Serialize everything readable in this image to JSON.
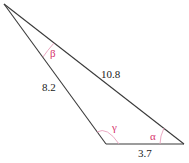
{
  "diagram": {
    "type": "triangle",
    "vertices": {
      "top": [
        4,
        4
      ],
      "bottom_left": [
        106,
        144
      ],
      "bottom_right": [
        184,
        144
      ]
    },
    "sides": [
      {
        "name": "left",
        "label": "8.2"
      },
      {
        "name": "hypotenuse",
        "label": "10.8"
      },
      {
        "name": "bottom",
        "label": "3.7"
      }
    ],
    "angles": [
      {
        "name": "beta",
        "label": "β",
        "vertex": "top"
      },
      {
        "name": "gamma",
        "label": "γ",
        "vertex": "bottom_left"
      },
      {
        "name": "alpha",
        "label": "α",
        "vertex": "bottom_right"
      }
    ],
    "colors": {
      "line": "#3a3a3a",
      "angle_label": "#d6336c",
      "angle_arc": "#e8a0bc"
    }
  }
}
